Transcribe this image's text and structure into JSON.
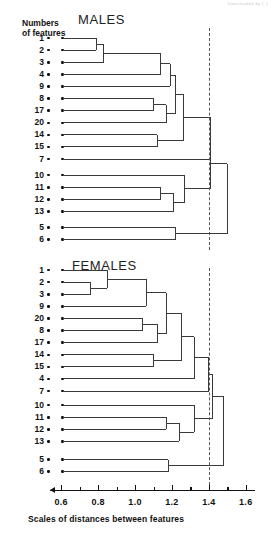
{
  "figure": {
    "artifact_text": "Downloaded by [..]",
    "y_axis_label_line1": "Numbers",
    "y_axis_label_line2": "of features",
    "x_axis_caption": "Scales of  distances between features",
    "line_color": "#3a3a3a",
    "dash_color": "#555555",
    "threshold_value": 1.4
  },
  "axis": {
    "min": 0.55,
    "max": 1.65,
    "px_min": 52,
    "px_max": 255,
    "major_ticks": [
      0.6,
      0.8,
      1.0,
      1.2,
      1.4,
      1.6
    ],
    "major_labels": [
      "0.6",
      "0.8",
      "1.0",
      "1.2",
      "1.4",
      "1.6"
    ],
    "minor_ticks": [
      0.7,
      0.9,
      1.1,
      1.3,
      1.5
    ]
  },
  "chart_data": {
    "type": "dendrogram",
    "xlabel": "Scales of  distances between features",
    "ylabel": "Numbers of features",
    "xlim": [
      0.55,
      1.65
    ],
    "grid": false,
    "legend": "none",
    "threshold_line": 1.4,
    "panels": [
      {
        "name": "males",
        "title": "MALES",
        "leaf_order": [
          "1",
          "2",
          "3",
          "4",
          "9",
          "8",
          "17",
          "20",
          "14",
          "15",
          "7",
          "10",
          "11",
          "12",
          "13",
          "5",
          "6"
        ],
        "leaf_start_distance": 0.61,
        "merges": [
          {
            "id": "m1",
            "children": [
              "1",
              "2"
            ],
            "distance": 0.79
          },
          {
            "id": "m2",
            "children": [
              "m1",
              "3"
            ],
            "distance": 0.83
          },
          {
            "id": "m3",
            "children": [
              "m2",
              "4"
            ],
            "distance": 1.14
          },
          {
            "id": "m4",
            "children": [
              "m3",
              "9"
            ],
            "distance": 1.19
          },
          {
            "id": "m5",
            "children": [
              "8",
              "17"
            ],
            "distance": 1.1
          },
          {
            "id": "m6",
            "children": [
              "m5",
              "20"
            ],
            "distance": 1.17
          },
          {
            "id": "m7",
            "children": [
              "m4",
              "m6"
            ],
            "distance": 1.22
          },
          {
            "id": "m8",
            "children": [
              "14",
              "15"
            ],
            "distance": 1.12
          },
          {
            "id": "m9",
            "children": [
              "m7",
              "m8"
            ],
            "distance": 1.26
          },
          {
            "id": "m10",
            "children": [
              "m9",
              "7"
            ],
            "distance": 1.41
          },
          {
            "id": "m11",
            "children": [
              "11",
              "12"
            ],
            "distance": 1.14
          },
          {
            "id": "m12",
            "children": [
              "m11",
              "13"
            ],
            "distance": 1.21
          },
          {
            "id": "m13",
            "children": [
              "10",
              "m12"
            ],
            "distance": 1.27
          },
          {
            "id": "m14",
            "children": [
              "m13",
              "m10"
            ],
            "distance": 1.41
          },
          {
            "id": "m15",
            "children": [
              "5",
              "6"
            ],
            "distance": 1.22
          },
          {
            "id": "m16",
            "children": [
              "m14",
              "m15"
            ],
            "distance": 1.5
          }
        ]
      },
      {
        "name": "females",
        "title": "FEMALES",
        "leaf_order": [
          "1",
          "2",
          "3",
          "9",
          "20",
          "8",
          "17",
          "14",
          "15",
          "4",
          "7",
          "10",
          "11",
          "12",
          "13",
          "5",
          "6"
        ],
        "leaf_start_distance": 0.61,
        "merges": [
          {
            "id": "f1",
            "children": [
              "2",
              "3"
            ],
            "distance": 0.76
          },
          {
            "id": "f2",
            "children": [
              "1",
              "f1"
            ],
            "distance": 0.85
          },
          {
            "id": "f3",
            "children": [
              "f2",
              "9"
            ],
            "distance": 1.06
          },
          {
            "id": "f4",
            "children": [
              "20",
              "8"
            ],
            "distance": 1.04
          },
          {
            "id": "f5",
            "children": [
              "f4",
              "17"
            ],
            "distance": 1.12
          },
          {
            "id": "f6",
            "children": [
              "f3",
              "f5"
            ],
            "distance": 1.17
          },
          {
            "id": "f7",
            "children": [
              "14",
              "15"
            ],
            "distance": 1.1
          },
          {
            "id": "f8",
            "children": [
              "f6",
              "f7"
            ],
            "distance": 1.25
          },
          {
            "id": "f9",
            "children": [
              "f8",
              "4"
            ],
            "distance": 1.32
          },
          {
            "id": "f10",
            "children": [
              "f9",
              "7"
            ],
            "distance": 1.4
          },
          {
            "id": "f11",
            "children": [
              "11",
              "12"
            ],
            "distance": 1.17
          },
          {
            "id": "f12",
            "children": [
              "f11",
              "13"
            ],
            "distance": 1.24
          },
          {
            "id": "f13",
            "children": [
              "10",
              "f12"
            ],
            "distance": 1.32
          },
          {
            "id": "f14",
            "children": [
              "f13",
              "f10"
            ],
            "distance": 1.42
          },
          {
            "id": "f15",
            "children": [
              "5",
              "6"
            ],
            "distance": 1.18
          },
          {
            "id": "f16",
            "children": [
              "f14",
              "f15"
            ],
            "distance": 1.48
          }
        ]
      }
    ]
  }
}
